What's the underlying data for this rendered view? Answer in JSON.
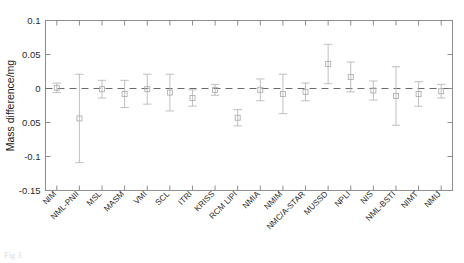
{
  "chart_data": {
    "type": "scatter",
    "title": "",
    "subtitle": "",
    "xlabel": "",
    "ylabel": "Mass difference/mg",
    "ylim": [
      -0.15,
      0.1
    ],
    "yticks": [
      0.1,
      0.05,
      0,
      -0.05,
      -0.1,
      -0.15
    ],
    "ytick_labels": [
      "0.1",
      "0.05",
      "0",
      "0.05",
      "-0.1",
      "-0.15"
    ],
    "grid": false,
    "legend": null,
    "reference_line": {
      "value": 0,
      "style": "dashed",
      "label": ""
    },
    "marker_style": "open-square",
    "error_bar_type": "symmetric",
    "categories": [
      "NIM",
      "NML-PNII",
      "MSL",
      "MASM",
      "VMI",
      "SCL",
      "ITRI",
      "KRISS",
      "RCM LIPI",
      "NMIA",
      "NMIM",
      "NMC/A-STAR",
      "MUSSD",
      "NPLI",
      "NIS",
      "NML-BSTI",
      "NIMT",
      "NMIJ"
    ],
    "values": [
      0.001,
      -0.044,
      -0.001,
      -0.008,
      -0.001,
      -0.006,
      -0.014,
      -0.002,
      -0.043,
      -0.002,
      -0.008,
      -0.005,
      0.036,
      0.017,
      -0.003,
      -0.011,
      -0.008,
      -0.004
    ],
    "errors": [
      0.007,
      0.065,
      0.013,
      0.02,
      0.022,
      0.027,
      0.012,
      0.008,
      0.012,
      0.016,
      0.029,
      0.013,
      0.029,
      0.022,
      0.014,
      0.043,
      0.018,
      0.01
    ]
  },
  "caption": {
    "text": "Fig 3 "
  }
}
